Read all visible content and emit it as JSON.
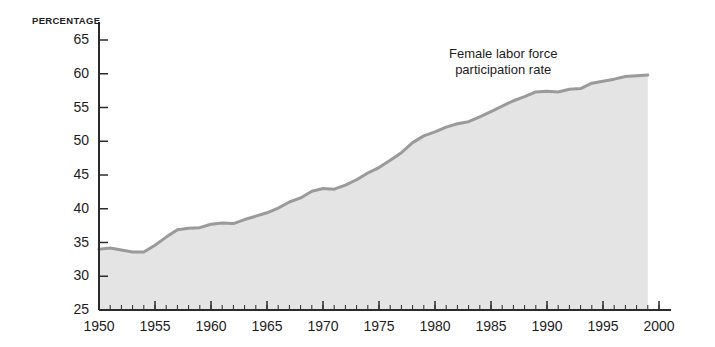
{
  "chart_data": {
    "type": "area",
    "title": "",
    "subtitle": "",
    "xlabel": "",
    "ylabel": "PERCENTAGE",
    "ylim": [
      25,
      65
    ],
    "xlim": [
      1950,
      2000
    ],
    "ytick_labels": [
      "65",
      "60",
      "55",
      "50",
      "45",
      "40",
      "35",
      "30",
      "25"
    ],
    "yticks": [
      65,
      60,
      55,
      50,
      45,
      40,
      35,
      30,
      25
    ],
    "xtick_labels": [
      "1950",
      "1955",
      "1960",
      "1965",
      "1970",
      "1975",
      "1980",
      "1985",
      "1990",
      "1995",
      "2000"
    ],
    "xticks": [
      1950,
      1955,
      1960,
      1965,
      1970,
      1975,
      1980,
      1985,
      1990,
      1995,
      2000
    ],
    "minor_xtick_interval": 1,
    "grid": false,
    "legend_position": "inline-annotation",
    "annotations": [
      {
        "text_line_1": "Female labor force",
        "text_line_2": "participation rate",
        "x": 1991,
        "y": 63
      }
    ],
    "series": [
      {
        "name": "Female labor force participation rate",
        "line_color": "#9a9a9a",
        "fill_color": "#e4e4e4",
        "x": [
          1950,
          1951,
          1952,
          1953,
          1954,
          1955,
          1956,
          1957,
          1958,
          1959,
          1960,
          1961,
          1962,
          1963,
          1964,
          1965,
          1966,
          1967,
          1968,
          1969,
          1970,
          1971,
          1972,
          1973,
          1974,
          1975,
          1976,
          1977,
          1978,
          1979,
          1980,
          1981,
          1982,
          1983,
          1984,
          1985,
          1986,
          1987,
          1988,
          1989,
          1990,
          1991,
          1992,
          1993,
          1994,
          1995,
          1996,
          1997,
          1998,
          1999
        ],
        "values": [
          34.0,
          34.2,
          33.9,
          33.6,
          33.6,
          34.6,
          35.8,
          36.9,
          37.1,
          37.2,
          37.7,
          37.9,
          37.8,
          38.4,
          38.9,
          39.4,
          40.1,
          41.0,
          41.6,
          42.6,
          43.0,
          42.9,
          43.5,
          44.3,
          45.3,
          46.1,
          47.2,
          48.3,
          49.8,
          50.8,
          51.4,
          52.1,
          52.6,
          52.9,
          53.6,
          54.4,
          55.2,
          56.0,
          56.6,
          57.3,
          57.4,
          57.3,
          57.7,
          57.8,
          58.6,
          58.9,
          59.2,
          59.6,
          59.7,
          59.8
        ]
      }
    ]
  },
  "axis": {
    "y_unit_label": "PERCENTAGE"
  }
}
